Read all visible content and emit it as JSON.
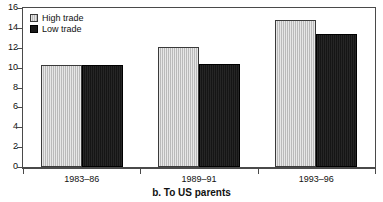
{
  "chart_data": {
    "type": "bar",
    "title": "",
    "caption": "b. To US parents",
    "xlabel": "",
    "ylabel": "",
    "ylim": [
      0,
      16
    ],
    "yticks": [
      0,
      2,
      4,
      6,
      8,
      10,
      12,
      14,
      16
    ],
    "ytick_labels": [
      "0",
      "2",
      "4",
      "6",
      "8",
      "10",
      "12",
      "14",
      "16"
    ],
    "grid": false,
    "legend_position": "top-left",
    "categories": [
      "1983–86",
      "1989–91",
      "1993–96"
    ],
    "series": [
      {
        "name": "High trade",
        "color": "#c9c9c9",
        "values": [
          10.3,
          12.1,
          14.8
        ]
      },
      {
        "name": "Low trade",
        "color": "#1a1a1a",
        "values": [
          10.3,
          10.4,
          13.4
        ]
      }
    ]
  },
  "legend": {
    "items": [
      {
        "label": "High trade",
        "swatch": "light-gray-swatch"
      },
      {
        "label": "Low trade",
        "swatch": "black-swatch"
      }
    ]
  }
}
